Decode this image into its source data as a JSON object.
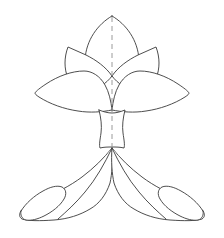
{
  "figure": {
    "title": "Symmetric botanical line drawing",
    "background_color": "#ffffff",
    "stroke_color": "#3a3a3a",
    "axis_color": "#9a9a9a",
    "fill_color": "#ffffff",
    "stroke_width": 0.9,
    "axis_stroke_width": 1.0,
    "axis_dash_pattern": "5 4",
    "width": 224,
    "height": 238,
    "parts": [
      {
        "name": "top-center-petal",
        "label": "Top center petal",
        "path": "M112,16 C126,24 138,40 139,60 C139,68 133,74 126,76 L112,76 L98,76 C91,74 85,68 85,60 C86,40 98,24 112,16 Z"
      },
      {
        "name": "mid-left-petal",
        "label": "Mid left petal",
        "path": "M112,76 C106,84 98,89 88,89 C78,89 72,84 68,78 C66,74 65,68 65,63 C65,58 66,52 68,47 C74,50 80,52 86,55 C96,60 106,67 112,76 Z"
      },
      {
        "name": "mid-right-petal",
        "label": "Mid right petal",
        "path": "M112,76 C118,84 126,89 136,89 C146,89 152,84 156,78 C158,74 159,68 159,63 C159,58 158,52 156,47 C150,50 144,52 138,55 C128,60 118,67 112,76 Z"
      },
      {
        "name": "large-left-petal",
        "label": "Large left petal",
        "path": "M112,110 C102,112 90,113 78,111 C64,109 50,104 39,97 C36,95 35,94 35,93 C36,91 40,88 46,84 C58,76 72,71 84,71 C92,71 100,76 105,85 C109,92 111,101 112,110 Z"
      },
      {
        "name": "large-right-petal",
        "label": "Large right petal",
        "path": "M112,110 C122,112 134,113 146,111 C160,109 174,104 185,97 C188,95 189,94 189,93 C188,91 184,88 178,84 C166,76 152,71 140,71 C132,71 124,76 119,85 C115,92 113,101 112,110 Z"
      },
      {
        "name": "stem",
        "label": "Central stem",
        "path": "M99,110 C101,118 102,126 101,133 C100,140 99,145 100,148 C104,147 108,147 112,147 C116,147 120,147 124,148 C125,145 124,140 123,133 C122,126 123,118 125,110 C120,112 116,113 112,113 C108,113 104,112 99,110 Z"
      },
      {
        "name": "lower-left-arm",
        "label": "Lower left arm",
        "path": "M112,148 C104,158 94,168 82,177 C70,186 56,193 43,198 C33,202 25,206 21,211 C19,214 19,217 22,219 C28,221 40,221 54,220 C68,219 80,215 90,209 C99,204 106,195 110,183 C112,174 113,161 112,148 Z"
      },
      {
        "name": "lower-right-arm",
        "label": "Lower right arm",
        "path": "M112,148 C120,158 130,168 142,177 C154,186 168,193 181,198 C191,202 199,206 203,211 C205,214 205,217 202,219 C196,221 184,221 170,220 C156,219 144,215 134,209 C125,204 118,195 114,183 C112,174 111,161 112,148 Z"
      },
      {
        "name": "left-arm-hook",
        "label": "Left arm curled tip",
        "path": "M21,211 C26,203 34,196 43,191 C50,187 57,185 62,187 C66,189 67,194 64,199 C60,206 52,212 44,216 C38,219 31,221 26,220 C22,219 20,215 21,211 Z"
      },
      {
        "name": "right-arm-hook",
        "label": "Right arm curled tip",
        "path": "M203,211 C198,203 190,196 181,191 C174,187 167,185 162,187 C158,189 157,194 160,199 C164,206 172,212 180,216 C186,219 193,221 198,220 C202,219 204,215 203,211 Z"
      },
      {
        "name": "left-arm-inner-vein",
        "label": "Left arm inner vein",
        "path": "M112,148 C105,163 96,179 85,192 C76,203 66,212 58,219"
      },
      {
        "name": "right-arm-inner-vein",
        "label": "Right arm inner vein",
        "path": "M112,148 C119,163 128,179 139,192 C148,203 158,212 166,219"
      }
    ],
    "axis": {
      "name": "symmetry-axis",
      "label": "Dashed symmetry axis",
      "path": "M112,17 L112,150"
    }
  }
}
